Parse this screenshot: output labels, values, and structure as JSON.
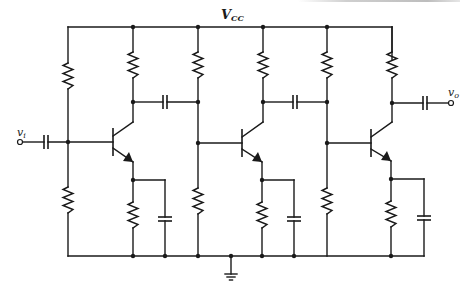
{
  "diagram": {
    "type": "three-stage RC-coupled common-emitter BJT amplifier",
    "labels": {
      "supply": "V",
      "supply_sub": "CC",
      "input": "v",
      "input_sub": "i",
      "output": "v",
      "output_sub": "o"
    },
    "stages": [
      {
        "name": "stage-1",
        "bias_x": 68,
        "collector_x": 133,
        "base_bar_x": 113
      },
      {
        "name": "stage-2",
        "bias_x": 198,
        "collector_x": 263,
        "base_bar_x": 242
      },
      {
        "name": "stage-3",
        "bias_x": 327,
        "collector_x": 392,
        "base_bar_x": 371
      }
    ],
    "components": {
      "resistors": 11,
      "capacitors": 7,
      "transistors": 3,
      "ground": 1
    },
    "colors": {
      "wire": "#1a1a1a",
      "background": "#ffffff"
    }
  }
}
